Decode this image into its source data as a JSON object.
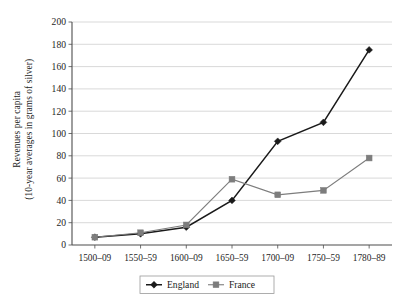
{
  "chart_data": {
    "type": "line",
    "title": "",
    "xlabel": "",
    "ylabel_line1": "Revenues per capita",
    "ylabel_line2": "(10-year averages in grams of silver)",
    "categories": [
      "1500–09",
      "1550–59",
      "1600–09",
      "1650–59",
      "1700–09",
      "1750–59",
      "1780–89"
    ],
    "ylim": [
      0,
      200
    ],
    "ytick_step": 20,
    "yticks": [
      "0",
      "20",
      "40",
      "60",
      "80",
      "100",
      "120",
      "140",
      "160",
      "180",
      "200"
    ],
    "grid": "horizontal",
    "legend_position": "bottom-center",
    "series": [
      {
        "name": "England",
        "color": "#1a1a1a",
        "marker": "diamond",
        "values": [
          7,
          10,
          16,
          40,
          93,
          110,
          175
        ]
      },
      {
        "name": "France",
        "color": "#7d7d7d",
        "marker": "square",
        "values": [
          7,
          11,
          18,
          59,
          45,
          49,
          78
        ]
      }
    ]
  },
  "legend": {
    "items": [
      {
        "label": "England"
      },
      {
        "label": "France"
      }
    ]
  },
  "colors": {
    "england": "#1a1a1a",
    "france": "#7d7d7d",
    "grid": "#c9c9c9",
    "axis": "#4d4d4d",
    "legend_border": "#9a9a9a"
  }
}
